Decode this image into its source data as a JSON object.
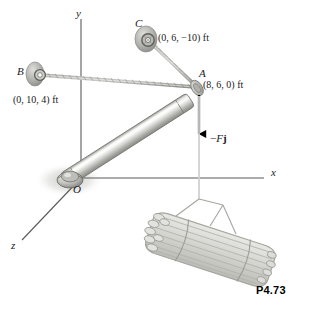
{
  "figure": {
    "problem_number": "P4.73",
    "background_color": "#ffffff",
    "ink_color": "#1a1a1a"
  },
  "axes": {
    "y_label": "y",
    "x_label": "x",
    "z_label": "z",
    "origin_label": "O",
    "axis_color": "#555555"
  },
  "points": [
    {
      "id": "B",
      "label": "B",
      "coordinate_text": "(0, 10, 4) ft",
      "kind": "wall-anchor-eyebolt"
    },
    {
      "id": "C",
      "label": "C",
      "coordinate_text": "(0, 6, −10) ft",
      "kind": "wall-anchor-eyebolt"
    },
    {
      "id": "A",
      "label": "A",
      "coordinate_text": "(8, 6, 0) ft",
      "kind": "boom-tip"
    },
    {
      "id": "O",
      "label": "O",
      "coordinate_text": "",
      "kind": "ball-and-socket-support"
    }
  ],
  "force": {
    "label_minus": "−",
    "label_magnitude": "F",
    "label_unit_vector": "j",
    "direction": "downward",
    "color": "#000000"
  },
  "members": {
    "boom_label": "boom-OA",
    "cable_ab_label": "cable-AB",
    "cable_ac_label": "cable-AC",
    "hoist_cable_label": "hoist-cable",
    "load_label": "pipe-bundle"
  },
  "colors": {
    "boom_light": "#f2f2f0",
    "boom_mid": "#c9c9c6",
    "boom_dark": "#8f8f8c",
    "cable": "#a8a8a4",
    "anchor": "#b5b5b2",
    "load_fill": "#d9d9d4",
    "load_stroke": "#a6a6a1",
    "shadow": "#cdcdc9"
  }
}
